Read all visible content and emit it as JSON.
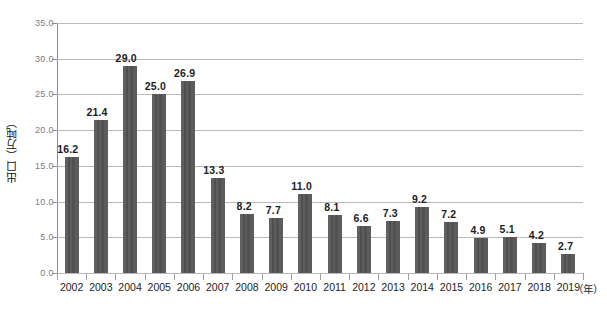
{
  "chart_data": {
    "type": "bar",
    "title": "",
    "subtitle": "",
    "xlabel": "年",
    "ylabel": "出口（万吨）",
    "x_unit_label": "（年）",
    "categories": [
      "2002",
      "2003",
      "2004",
      "2005",
      "2006",
      "2007",
      "2008",
      "2009",
      "2010",
      "2011",
      "2012",
      "2013",
      "2014",
      "2015",
      "2016",
      "2017",
      "2018",
      "2019"
    ],
    "values": [
      16.2,
      21.4,
      29.0,
      25.0,
      26.9,
      13.3,
      8.2,
      7.7,
      11.0,
      8.1,
      6.6,
      7.3,
      9.2,
      7.2,
      4.9,
      5.1,
      4.2,
      2.7
    ],
    "value_labels": [
      "16.2",
      "21.4",
      "29.0",
      "25.0",
      "26.9",
      "13.3",
      "8.2",
      "7.7",
      "11.0",
      "8.1",
      "6.6",
      "7.3",
      "9.2",
      "7.2",
      "4.9",
      "5.1",
      "4.2",
      "2.7"
    ],
    "ylim": [
      0,
      35
    ],
    "ytick_values": [
      0,
      5,
      10,
      15,
      20,
      25,
      30,
      35
    ],
    "ytick_labels": [
      "0.0",
      "5.0",
      "10.0",
      "15.0",
      "20.0",
      "25.0",
      "30.0",
      "35.0"
    ],
    "grid": true,
    "grid_axis": "y",
    "legend": false,
    "legend_position": "none",
    "series_name": "出口",
    "bar_color": "#585858",
    "grid_color": "#b9b9b9",
    "axis_color": "#8d8d8d",
    "label_color": "#1d1d1d",
    "tick_label_color": "#7d7d7d",
    "background_color": "#ffffff",
    "data_labels_shown": true
  }
}
